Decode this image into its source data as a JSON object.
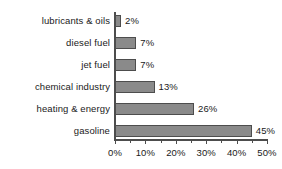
{
  "chart_data": {
    "type": "bar",
    "orientation": "horizontal",
    "title": "",
    "xlabel": "",
    "ylabel": "",
    "xlim": [
      0,
      50
    ],
    "xtick_labels": [
      "0%",
      "10%",
      "20%",
      "30%",
      "40%",
      "50%"
    ],
    "xticks": [
      0,
      10,
      20,
      30,
      40,
      50
    ],
    "minor_tick_step": 5,
    "grid": false,
    "legend": false,
    "bar_color": "#8a8a8a",
    "bar_edge_color": "#4d4d4d",
    "axis_color": "#4d4d4d",
    "text_color": "#1a1a1a",
    "categories": [
      "lubricants & oils",
      "diesel fuel",
      "jet fuel",
      "chemical industry",
      "heating & energy",
      "gasoline"
    ],
    "values": [
      2,
      7,
      7,
      13,
      26,
      45
    ],
    "value_labels": [
      "2%",
      "7%",
      "7%",
      "13%",
      "26%",
      "45%"
    ]
  }
}
